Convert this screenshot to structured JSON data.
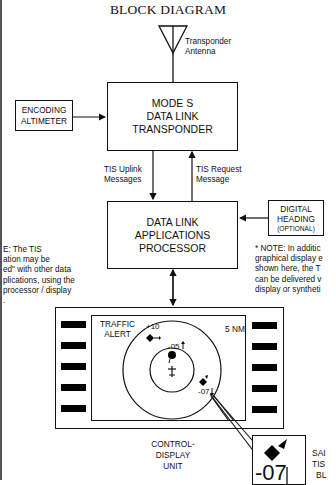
{
  "title": "BLOCK DIAGRAM",
  "antenna": {
    "label_line1": "Transponder",
    "label_line2": "Antenna"
  },
  "encoding_altimeter": {
    "line1": "ENCODING",
    "line2": "ALTIMETER"
  },
  "transponder": {
    "line1": "MODE S",
    "line2": "DATA LINK",
    "line3": "TRANSPONDER"
  },
  "uplink": {
    "line1": "TIS Uplink",
    "line2": "Messages"
  },
  "request": {
    "line1": "TIS Request",
    "line2": "Message"
  },
  "processor": {
    "line1": "DATA LINK",
    "line2": "APPLICATIONS",
    "line3": "PROCESSOR"
  },
  "digital_heading": {
    "line1": "DIGITAL",
    "line2": "HEADING",
    "line3": "(OPTIONAL)"
  },
  "left_note": {
    "lines": [
      "E: The TIS",
      "ation may be",
      "ed\" with other data",
      "plications, using the",
      "processor / display",
      "."
    ]
  },
  "right_note": {
    "lines": [
      "* NOTE: In additic",
      "graphical display e",
      "shown here, the T",
      "can be delivered v",
      "display or syntheti"
    ]
  },
  "display": {
    "traffic_alert_line1": "TRAFFIC",
    "traffic_alert_line2": "ALERT",
    "range": "5 NM",
    "targets": [
      {
        "altitude": "+10",
        "trend": "level"
      },
      {
        "altitude": "-05",
        "trend": "climbing"
      },
      {
        "altitude": "-07",
        "trend": "descending"
      }
    ]
  },
  "cdu_label": {
    "line1": "CONTROL-",
    "line2": "DISPLAY",
    "line3": "UNIT"
  },
  "callout": {
    "altitude": "-07"
  },
  "callout_text": {
    "line1": "SAI",
    "line2": "TIS",
    "line3": "BL"
  }
}
